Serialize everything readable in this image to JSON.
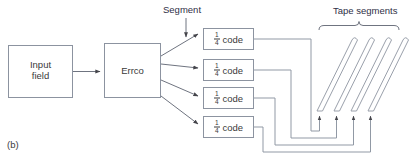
{
  "figure": {
    "panel_letter": "(b)",
    "annotations": {
      "segment": "Segment",
      "tape_segments": "Tape segments"
    },
    "blocks": [
      {
        "id": "input-field",
        "label_line1": "Input",
        "label_line2": "field"
      },
      {
        "id": "errco",
        "label_line1": "Errco",
        "label_line2": ""
      }
    ],
    "code_blocks": [
      {
        "numerator": "1",
        "denominator": "4",
        "label": "code"
      },
      {
        "numerator": "1",
        "denominator": "4",
        "label": "code"
      },
      {
        "numerator": "1",
        "denominator": "4",
        "label": "code"
      },
      {
        "numerator": "1",
        "denominator": "4",
        "label": "code"
      }
    ],
    "tape_segment_count": 4,
    "colors": {
      "stroke": "#8a909c",
      "box_stroke": "#8c93a0",
      "text": "#3a3a3a",
      "annotation_text": "#2f2f46",
      "background": "#ffffff",
      "arrow_fill": "#44444a"
    }
  }
}
